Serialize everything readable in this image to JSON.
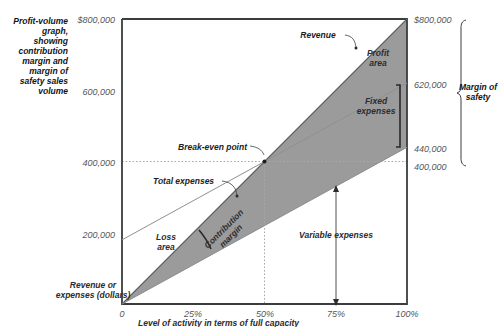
{
  "figure": {
    "caption": "Profit-volume graph, showing contribution margin and margin of safety sales volume",
    "y_axis_caption": "Revenue or expenses (dollars)",
    "x_axis_caption": "Level of activity in terms of full capacity",
    "right_caption": "Margin of safety"
  },
  "chart_data": {
    "type": "line",
    "xlabel": "Level of activity in terms of full capacity",
    "ylabel": "Revenue or expenses (dollars)",
    "xlim": [
      0,
      100
    ],
    "ylim": [
      0,
      800000
    ],
    "grid": false,
    "legend": "none",
    "x_ticks": [
      "0",
      "25%",
      "50%",
      "75%",
      "100%"
    ],
    "x_tick_values": [
      0,
      25,
      50,
      75,
      100
    ],
    "y_ticks": [
      "$800,000",
      "600,000",
      "400,000",
      "200,000"
    ],
    "y_tick_values": [
      800000,
      600000,
      400000,
      200000
    ],
    "right_axis_ticks": [
      "$800,000",
      "620,000",
      "440,000",
      "400,000"
    ],
    "right_axis_tick_values": [
      800000,
      620000,
      440000,
      400000
    ],
    "series": [
      {
        "name": "Revenue",
        "x": [
          0,
          100
        ],
        "values": [
          0,
          800000
        ]
      },
      {
        "name": "Total expenses",
        "x": [
          0,
          100
        ],
        "values": [
          180000,
          620000
        ]
      },
      {
        "name": "Variable expenses",
        "x": [
          0,
          100
        ],
        "values": [
          0,
          440000
        ]
      }
    ],
    "break_even": {
      "label": "Break-even point",
      "x": 50,
      "y": 400000
    },
    "regions": [
      {
        "name": "Profit area",
        "label": "Profit\narea",
        "fill": "#9b9b9b"
      },
      {
        "name": "Loss area",
        "label": "Loss\narea",
        "fill": "#ffffff"
      },
      {
        "name": "Contribution margin",
        "label": "Contribution\nmargin",
        "fill": "#9b9b9b"
      },
      {
        "name": "Variable expenses",
        "label": "Variable expenses",
        "fill": "#ffffff"
      },
      {
        "name": "Fixed expenses",
        "label": "Fixed\nexpenses",
        "fill": "#9b9b9b"
      }
    ],
    "annotations": [
      "Revenue",
      "Total expenses",
      "Break-even point",
      "Profit area",
      "Fixed expenses",
      "Loss area",
      "Contribution margin",
      "Variable expenses",
      "Margin of safety"
    ],
    "colors": {
      "shade": "#9b9b9b",
      "axis": "#3a3c3e",
      "text": "#1c1e20",
      "guide": "#a8a8a8",
      "background": "#ffffff"
    }
  },
  "labels": {
    "revenue": "Revenue",
    "total_expenses": "Total expenses",
    "break_even": "Break-even point",
    "profit_area_1": "Profit",
    "profit_area_2": "area",
    "fixed_expenses_1": "Fixed",
    "fixed_expenses_2": "expenses",
    "loss_area_1": "Loss",
    "loss_area_2": "area",
    "contribution_margin_1": "Contribution",
    "contribution_margin_2": "margin",
    "variable_expenses": "Variable expenses",
    "margin_of_safety_1": "Margin of",
    "margin_of_safety_2": "safety"
  },
  "caption_lines": [
    "Profit-volume",
    "graph,",
    "showing",
    "contribution",
    "margin and",
    "margin of",
    "safety sales",
    "volume"
  ],
  "y_axis_caption_lines": [
    "Revenue or",
    "expenses (dollars)"
  ],
  "x_tick_labels": [
    "0",
    "25%",
    "50%",
    "75%",
    "100%"
  ],
  "y_tick_labels": [
    "$800,000",
    "600,000",
    "400,000",
    "200,000"
  ],
  "right_tick_labels": [
    "$800,000",
    "620,000",
    "440,000",
    "400,000"
  ]
}
